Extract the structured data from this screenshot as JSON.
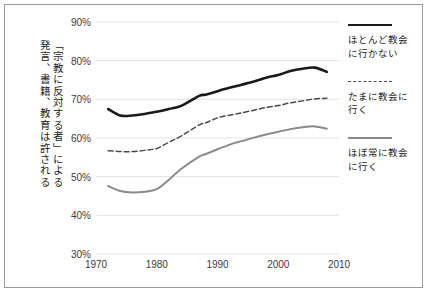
{
  "chart_data": {
    "type": "line",
    "title": "",
    "xlabel": "",
    "ylabel": "「宗教に反対する者」による\n発言、書籍、教育は許される",
    "ylabel_columns": [
      "「宗教に反対する者」による",
      "発言、書籍、教育は許される"
    ],
    "xlim": [
      1970,
      2010
    ],
    "ylim": [
      30,
      90
    ],
    "x_ticks": [
      "1970",
      "1980",
      "1990",
      "2000",
      "2010"
    ],
    "x_tick_values": [
      1970,
      1980,
      1990,
      2000,
      2010
    ],
    "y_ticks": [
      "30%",
      "40%",
      "50%",
      "60%",
      "70%",
      "80%",
      "90%"
    ],
    "y_tick_values": [
      30,
      40,
      50,
      60,
      70,
      80,
      90
    ],
    "grid": "horizontal",
    "legend_position": "right",
    "x": [
      1972,
      1974,
      1976,
      1978,
      1980,
      1982,
      1984,
      1987,
      1988,
      1990,
      1991,
      1993,
      1994,
      1996,
      1998,
      2000,
      2002,
      2004,
      2006,
      2008
    ],
    "series": [
      {
        "name": "ほとんど教会に行かない",
        "style": "solid",
        "color": "#1a1a1a",
        "width": 2.6,
        "values": [
          67.5,
          65.8,
          65.8,
          66.2,
          66.8,
          67.5,
          68.3,
          70.9,
          71.2,
          72.1,
          72.6,
          73.4,
          73.8,
          74.6,
          75.6,
          76.3,
          77.3,
          77.9,
          78.2,
          77.1
        ]
      },
      {
        "name": "たまに教会に行く",
        "style": "dashed",
        "color": "#4a4a4a",
        "width": 1.5,
        "values": [
          56.7,
          56.5,
          56.5,
          56.8,
          57.3,
          58.9,
          60.5,
          63.4,
          63.9,
          65.2,
          65.6,
          66.2,
          66.5,
          67.2,
          67.9,
          68.4,
          69.1,
          69.6,
          70.1,
          70.3
        ]
      },
      {
        "name": "ほぼ常に教会に行く",
        "style": "solid",
        "color": "#8a8a8a",
        "width": 2.0,
        "values": [
          47.6,
          46.3,
          45.9,
          46.1,
          46.8,
          49.2,
          52.0,
          55.2,
          55.8,
          57.1,
          57.7,
          58.8,
          59.2,
          60.1,
          60.9,
          61.6,
          62.3,
          62.8,
          63.0,
          62.4
        ]
      }
    ],
    "legend": [
      {
        "label_line1": "ほとんど教会",
        "label_line2": "に行かない",
        "style": "solid-dark"
      },
      {
        "label_line1": "たまに教会に",
        "label_line2": "行く",
        "style": "dashed"
      },
      {
        "label_line1": "ほぼ常に教会",
        "label_line2": "に行く",
        "style": "solid-gray"
      }
    ]
  }
}
